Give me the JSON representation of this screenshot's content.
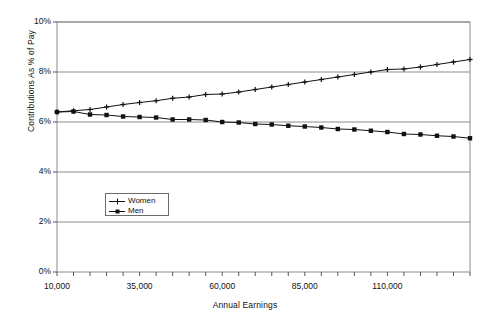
{
  "chart_data": {
    "type": "line",
    "title": "",
    "xlabel": "Annual Earnings",
    "ylabel": "Contributions As % of Pay",
    "xlim": [
      10000,
      135000
    ],
    "ylim": [
      0,
      10
    ],
    "y_tick_labels": [
      "0%",
      "2%",
      "4%",
      "6%",
      "8%",
      "10%"
    ],
    "y_tick_values": [
      0,
      2,
      4,
      6,
      8,
      10
    ],
    "x_tick_labels": [
      "10,000",
      "35,000",
      "60,000",
      "85,000",
      "110,000"
    ],
    "x_tick_values": [
      10000,
      35000,
      60000,
      85000,
      110000
    ],
    "grid": "horizontal",
    "legend_position": "inside-lower-left",
    "x": [
      10000,
      15000,
      20000,
      25000,
      30000,
      35000,
      40000,
      45000,
      50000,
      55000,
      60000,
      65000,
      70000,
      75000,
      80000,
      85000,
      90000,
      95000,
      100000,
      105000,
      110000,
      115000,
      120000,
      125000,
      130000,
      135000
    ],
    "series": [
      {
        "name": "Women",
        "marker": "plus",
        "values": [
          6.4,
          6.45,
          6.5,
          6.6,
          6.7,
          6.78,
          6.85,
          6.95,
          7.0,
          7.1,
          7.12,
          7.2,
          7.3,
          7.4,
          7.5,
          7.6,
          7.7,
          7.8,
          7.9,
          8.0,
          8.1,
          8.12,
          8.2,
          8.3,
          8.4,
          8.5
        ]
      },
      {
        "name": "Men",
        "marker": "square",
        "values": [
          6.4,
          6.42,
          6.3,
          6.28,
          6.22,
          6.2,
          6.18,
          6.1,
          6.1,
          6.08,
          6.0,
          5.98,
          5.92,
          5.9,
          5.85,
          5.82,
          5.78,
          5.72,
          5.7,
          5.65,
          5.6,
          5.52,
          5.5,
          5.45,
          5.42,
          5.35
        ]
      }
    ]
  },
  "legend": {
    "items": [
      {
        "label": "Women"
      },
      {
        "label": "Men"
      }
    ]
  },
  "axes": {
    "x_title": "Annual Earnings",
    "y_title": "Contributions As % of Pay"
  }
}
